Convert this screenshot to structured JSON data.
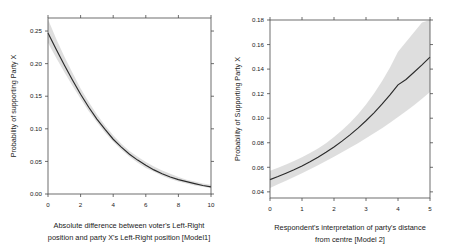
{
  "figure": {
    "background": "#ffffff",
    "panel_count": 2
  },
  "chart_data": [
    {
      "type": "line",
      "panel": "left",
      "title": "",
      "xlabel": "Absolute difference between voter's Left-Right position and party X's Left-Right position [Model1]",
      "ylabel": "Probability of supporting Party X",
      "xlim": [
        0,
        10
      ],
      "ylim": [
        0.0,
        0.27
      ],
      "grid": false,
      "legend": "none",
      "xticks": [
        0,
        2,
        4,
        6,
        8,
        10
      ],
      "xtick_labels": [
        "0",
        "2",
        "4",
        "6",
        "8",
        "10"
      ],
      "yticks": [
        0.0,
        0.05,
        0.1,
        0.15,
        0.2,
        0.25
      ],
      "ytick_labels": [
        "0.00",
        "0.05",
        "0.10",
        "0.15",
        "0.20",
        "0.25"
      ],
      "line_color": "#2b2b2b",
      "band_color": "#c9c9c9",
      "x": [
        0,
        0.5,
        1,
        1.5,
        2,
        2.5,
        3,
        3.5,
        4,
        4.5,
        5,
        5.5,
        6,
        6.5,
        7,
        7.5,
        8,
        8.5,
        9,
        9.5,
        10
      ],
      "fit": [
        0.247,
        0.222,
        0.198,
        0.175,
        0.153,
        0.133,
        0.115,
        0.099,
        0.084,
        0.072,
        0.061,
        0.052,
        0.044,
        0.037,
        0.031,
        0.026,
        0.022,
        0.019,
        0.016,
        0.013,
        0.011
      ],
      "ci_lower": [
        0.232,
        0.209,
        0.187,
        0.166,
        0.146,
        0.127,
        0.11,
        0.094,
        0.08,
        0.068,
        0.057,
        0.048,
        0.04,
        0.034,
        0.028,
        0.023,
        0.019,
        0.016,
        0.013,
        0.011,
        0.009
      ],
      "ci_upper": [
        0.268,
        0.238,
        0.211,
        0.186,
        0.162,
        0.141,
        0.122,
        0.105,
        0.09,
        0.077,
        0.066,
        0.057,
        0.049,
        0.042,
        0.036,
        0.031,
        0.026,
        0.022,
        0.019,
        0.016,
        0.014
      ]
    },
    {
      "type": "line",
      "panel": "right",
      "title": "",
      "xlabel": "Respondent's interpretation of party's distance from centre [Model 2]",
      "ylabel": "Probability of Supporting Party X",
      "xlim": [
        0,
        5
      ],
      "ylim": [
        0.035,
        0.18
      ],
      "grid": false,
      "legend": "none",
      "xticks": [
        0,
        1,
        2,
        3,
        4,
        5
      ],
      "xtick_labels": [
        "0",
        "1",
        "2",
        "3",
        "4",
        "5"
      ],
      "yticks": [
        0.04,
        0.06,
        0.08,
        0.1,
        0.12,
        0.14,
        0.16,
        0.18
      ],
      "ytick_labels": [
        "0.04",
        "0.06",
        "0.08",
        "0.10",
        "0.12",
        "0.14",
        "0.16",
        "0.18"
      ],
      "line_color": "#2b2b2b",
      "band_color": "#c9c9c9",
      "x": [
        0,
        0.25,
        0.5,
        0.75,
        1,
        1.25,
        1.5,
        1.75,
        2,
        2.25,
        2.5,
        2.75,
        3,
        3.25,
        3.5,
        3.75,
        4,
        4.25,
        4.5,
        4.75,
        5
      ],
      "fit": [
        0.05,
        0.0525,
        0.0552,
        0.058,
        0.0611,
        0.0645,
        0.0682,
        0.0722,
        0.0766,
        0.0813,
        0.0864,
        0.0919,
        0.0979,
        0.1044,
        0.1114,
        0.119,
        0.1272,
        0.1316,
        0.1374,
        0.1434,
        0.1497
      ],
      "ci_lower": [
        0.0432,
        0.0461,
        0.0491,
        0.0521,
        0.0552,
        0.0584,
        0.0617,
        0.0651,
        0.0686,
        0.0722,
        0.0759,
        0.0797,
        0.0836,
        0.0877,
        0.0919,
        0.0963,
        0.1009,
        0.1056,
        0.1105,
        0.1158,
        0.1214
      ],
      "ci_upper": [
        0.0572,
        0.0597,
        0.0623,
        0.0651,
        0.0682,
        0.0716,
        0.0754,
        0.0797,
        0.0846,
        0.0901,
        0.0963,
        0.1033,
        0.1112,
        0.1201,
        0.1301,
        0.1414,
        0.1541,
        0.162,
        0.17,
        0.178,
        0.18
      ]
    }
  ],
  "left_panel": {
    "y_axis_title": "Probability of supporting Party X",
    "caption_line1": "Absolute difference between voter's Left-Right",
    "caption_line2": "position and party X's Left-Right position [Model1]",
    "xtick_labels": [
      "0",
      "2",
      "4",
      "6",
      "8",
      "10"
    ],
    "ytick_labels": [
      "0.00",
      "0.05",
      "0.10",
      "0.15",
      "0.20",
      "0.25"
    ]
  },
  "right_panel": {
    "y_axis_title": "Probability of Supporting Party X",
    "caption_line1": "Respondent's interpretation of party's distance",
    "caption_line2": "from centre [Model 2]",
    "xtick_labels": [
      "0",
      "1",
      "2",
      "3",
      "4",
      "5"
    ],
    "ytick_labels": [
      "0.04",
      "0.06",
      "0.08",
      "0.10",
      "0.12",
      "0.14",
      "0.16",
      "0.18"
    ]
  }
}
